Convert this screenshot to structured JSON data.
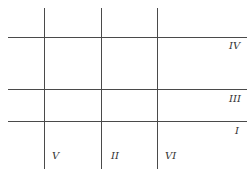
{
  "diagram": {
    "horizontal_lines": [
      {
        "id": "IV",
        "label": "IV",
        "y": 37
      },
      {
        "id": "III",
        "label": "III",
        "y": 89
      },
      {
        "id": "I",
        "label": "I",
        "y": 121
      }
    ],
    "vertical_lines": [
      {
        "id": "V",
        "label": "V",
        "x": 44
      },
      {
        "id": "II",
        "label": "II",
        "x": 101
      },
      {
        "id": "VI",
        "label": "VI",
        "x": 157
      }
    ],
    "line_color": "#4a4a4a"
  }
}
